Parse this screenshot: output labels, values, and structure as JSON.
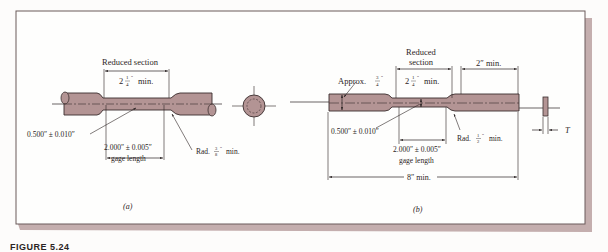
{
  "colors": {
    "specimen_fill": "#b39494",
    "specimen_stroke": "#3a2e2e",
    "frame_stroke": "#6b5a5a",
    "frame_shadow": "#c4aeae",
    "text": "#2b2424",
    "background": "#fdfcfb"
  },
  "figure_a": {
    "reduced_section_label": "Reduced section",
    "reduced_length": "2",
    "reduced_frac_num": "1",
    "reduced_frac_den": "4",
    "reduced_suffix": "min.",
    "diameter_label": "0.500″ ± 0.010″",
    "gage_length_value": "2.000″ ± 0.005″",
    "gage_length_label": "gage length",
    "radius_prefix": "Rad.",
    "radius_frac_num": "3",
    "radius_frac_den": "8",
    "radius_suffix": "min.",
    "sublabel": "(a)"
  },
  "figure_b": {
    "reduced_section_line1": "Reduced",
    "reduced_section_line2": "section",
    "reduced_length": "2",
    "reduced_frac_num": "1",
    "reduced_frac_den": "4",
    "reduced_suffix": "min.",
    "grip_length_label": "2″ min.",
    "width_prefix": "Approx.",
    "width_frac_num": "3",
    "width_frac_den": "4",
    "width_label": "0.500″ ± 0.010″",
    "gage_length_value": "2.000″ ± 0.005″",
    "gage_length_label": "gage length",
    "radius_prefix": "Rad.",
    "radius_frac_num": "1",
    "radius_frac_den": "2",
    "radius_suffix": "min.",
    "overall_length_label": "8″ min.",
    "thickness_label": "T",
    "sublabel": "(b)"
  },
  "caption": {
    "text": "FIGURE 5.24"
  }
}
